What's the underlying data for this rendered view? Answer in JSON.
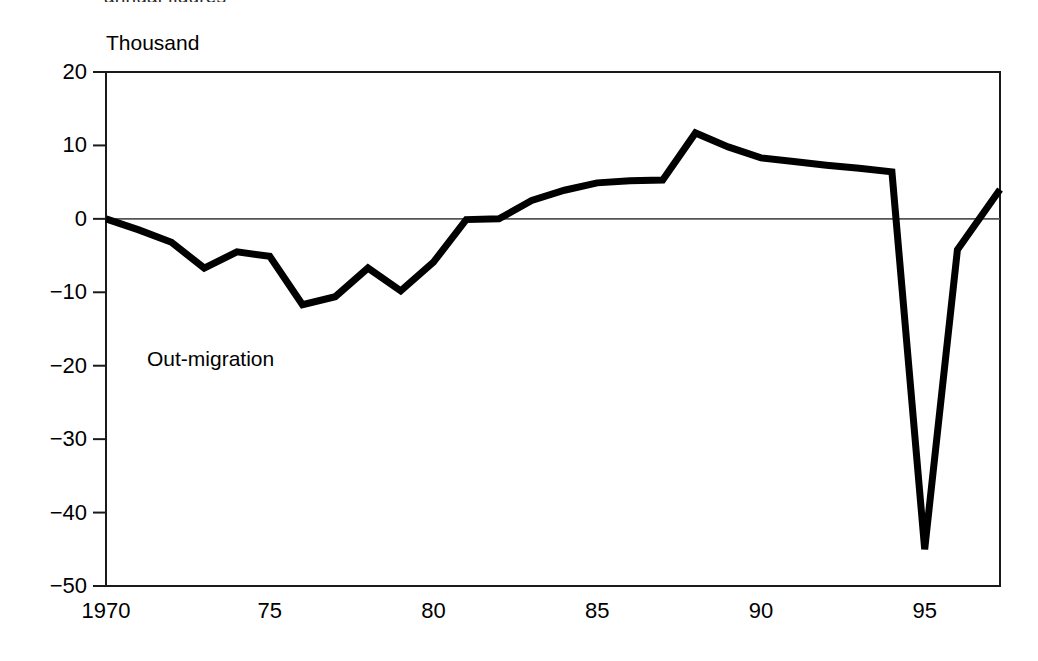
{
  "figure": {
    "clipped_text_above": "annual figures",
    "unit_label": "Thousand",
    "series_annotation": "Out-migration",
    "line_color": "#000000",
    "axis_color": "#1a1a1a",
    "zero_line_color": "#555555",
    "background_color": "#ffffff"
  },
  "axes": {
    "y_tick_labels": [
      "20",
      "10",
      "0",
      "−10",
      "−20",
      "−30",
      "−40",
      "−50"
    ],
    "x_tick_labels": [
      "1970",
      "75",
      "80",
      "85",
      "90",
      "95"
    ]
  },
  "chart_data": {
    "type": "line",
    "title": "",
    "subtitle": "",
    "xlabel": "",
    "ylabel": "Thousand",
    "ylim": [
      -50,
      20
    ],
    "xlim": [
      1970,
      1997.3
    ],
    "grid": false,
    "legend_position": "none",
    "y_ticks": [
      20,
      10,
      0,
      -10,
      -20,
      -30,
      -40,
      -50
    ],
    "x_ticks": [
      1970,
      1975,
      1980,
      1985,
      1990,
      1995
    ],
    "x_tick_labels": [
      "1970",
      "75",
      "80",
      "85",
      "90",
      "95"
    ],
    "annotations": [
      {
        "text": "Thousand",
        "x": 1970,
        "y": 23,
        "role": "axis-unit"
      },
      {
        "text": "Out-migration",
        "x": 1971.3,
        "y": -17.5,
        "role": "series-label"
      }
    ],
    "reference_lines": [
      {
        "y": 0,
        "style": "thin-solid"
      }
    ],
    "series": [
      {
        "name": "Net migration",
        "x": [
          1970,
          1971,
          1972,
          1973,
          1974,
          1975,
          1976,
          1977,
          1978,
          1979,
          1980,
          1981,
          1982,
          1983,
          1984,
          1985,
          1986,
          1987,
          1988,
          1989,
          1990,
          1991,
          1992,
          1993,
          1994,
          1995,
          1996,
          1997.3
        ],
        "values": [
          0,
          -1.5,
          -3.2,
          -6.7,
          -4.5,
          -5.1,
          -11.7,
          -10.6,
          -6.7,
          -9.8,
          -5.9,
          -0.1,
          0,
          2.5,
          3.9,
          4.9,
          5.2,
          5.3,
          11.7,
          9.8,
          8.3,
          7.8,
          7.3,
          6.9,
          6.4,
          -45,
          -4.2,
          4
        ]
      }
    ]
  }
}
